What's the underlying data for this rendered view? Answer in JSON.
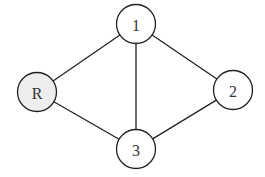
{
  "diagram": {
    "type": "graph",
    "directed": false,
    "nodes": [
      {
        "id": "R",
        "label": "R",
        "x": 37,
        "y": 92,
        "r": 19.5,
        "fill": "#eeeeee"
      },
      {
        "id": "1",
        "label": "1",
        "x": 136,
        "y": 24,
        "r": 19.5,
        "fill": "#ffffff"
      },
      {
        "id": "2",
        "label": "2",
        "x": 233,
        "y": 90,
        "r": 19.5,
        "fill": "#ffffff"
      },
      {
        "id": "3",
        "label": "3",
        "x": 136,
        "y": 149,
        "r": 19.5,
        "fill": "#ffffff"
      }
    ],
    "edges": [
      {
        "from": "R",
        "to": "1"
      },
      {
        "from": "R",
        "to": "3"
      },
      {
        "from": "1",
        "to": "3"
      },
      {
        "from": "1",
        "to": "2"
      },
      {
        "from": "3",
        "to": "2"
      }
    ],
    "colors": {
      "stroke": "#222222",
      "root_fill": "#eeeeee",
      "node_fill": "#ffffff"
    }
  }
}
